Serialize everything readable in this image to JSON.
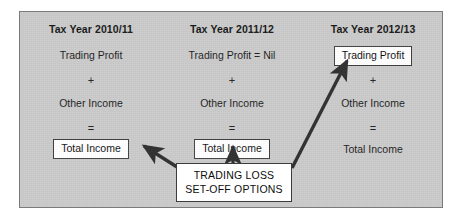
{
  "diagram": {
    "title_text": "TRADING LOSS SET-OFF OPTIONS",
    "panel_bg": "#c9c9c9",
    "panel_border": "#7a7a7a",
    "box_bg": "#ffffff",
    "box_border": "#3b3b3b",
    "arrow_color": "#333333",
    "columns": [
      {
        "header": "Tax Year 2010/11",
        "profit_label": "Trading Profit",
        "profit_boxed": false,
        "plus": "+",
        "other_label": "Other Income",
        "equals": "=",
        "total_label": "Total Income",
        "total_boxed": true
      },
      {
        "header": "Tax Year 2011/12",
        "profit_label": "Trading Profit = Nil",
        "profit_boxed": false,
        "plus": "+",
        "other_label": "Other Income",
        "equals": "=",
        "total_label": "Total Income",
        "total_boxed": true
      },
      {
        "header": "Tax Year 2012/13",
        "profit_label": "Trading Profit",
        "profit_boxed": true,
        "plus": "+",
        "other_label": "Other Income",
        "equals": "=",
        "total_label": "Total Income",
        "total_boxed": false
      }
    ],
    "callout": {
      "line1": "TRADING LOSS",
      "line2": "SET-OFF OPTIONS"
    },
    "arrows": [
      {
        "name": "arrow-to-2010-total-income",
        "from": "callout",
        "to": "Total Income (2010/11)"
      },
      {
        "name": "arrow-to-2011-total-income",
        "from": "callout",
        "to": "Total Income (2011/12)"
      },
      {
        "name": "arrow-to-2012-trading-profit",
        "from": "callout",
        "to": "Trading Profit (2012/13)"
      }
    ]
  }
}
